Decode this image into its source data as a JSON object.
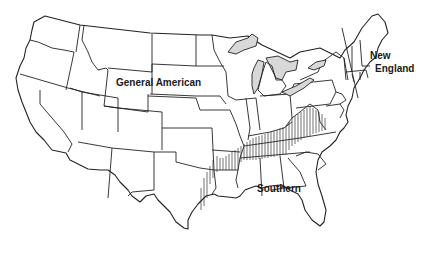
{
  "map": {
    "subject": "United States dialect regions",
    "regions": [
      {
        "id": "general-american",
        "label": "General American"
      },
      {
        "id": "new-england",
        "label_line1": "New",
        "label_line2": "England"
      },
      {
        "id": "southern",
        "label": "Southern"
      }
    ],
    "transition_zone": "hatched band between General American and Southern regions",
    "new_england_boundary": "diagonal line west of New England"
  }
}
